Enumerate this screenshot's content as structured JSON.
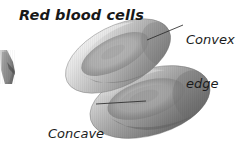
{
  "figure": {
    "title": "Red blood cells",
    "background_color": "#ffffff",
    "width": 237,
    "height": 143
  },
  "labels": {
    "convex": {
      "line1": "Convex",
      "line2": "edge"
    },
    "concave": {
      "line1": "Concave",
      "line2": "middle"
    }
  },
  "colors": {
    "ink": "#1a1a1a",
    "leader_line": "#2b2b2b",
    "cell_highlight": "#f2f2f2",
    "cell_midtone": "#b8b8b8",
    "cell_shadow": "#6f6f6f",
    "cell_deep_shadow": "#4a4a4a",
    "vessel_gray": "#7a7a7a"
  },
  "illustration": {
    "type": "biconcave-disc-diagram",
    "cells": [
      {
        "name": "upper-red-blood-cell",
        "center_x": 118,
        "center_y": 56,
        "radius_x": 57,
        "radius_y": 30,
        "rotation_deg": -27,
        "description": "tilted biconcave disc showing convex rim and concave dimple"
      },
      {
        "name": "lower-red-blood-cell",
        "center_x": 150,
        "center_y": 102,
        "radius_x": 62,
        "radius_y": 33,
        "rotation_deg": -17,
        "description": "larger overlapping biconcave disc cropped at the bottom edge"
      }
    ],
    "vessel_fragment": {
      "name": "capillary-fragment",
      "x": 1,
      "y": 50,
      "width": 14,
      "height": 34,
      "description": "small cropped tube fragment at the left border"
    },
    "leader_lines": [
      {
        "name": "convex-leader-line",
        "from_x": 183,
        "from_y": 25,
        "to_x": 147,
        "to_y": 40
      },
      {
        "name": "concave-leader-line",
        "from_x": 96,
        "from_y": 104,
        "to_x": 146,
        "to_y": 101
      }
    ]
  }
}
